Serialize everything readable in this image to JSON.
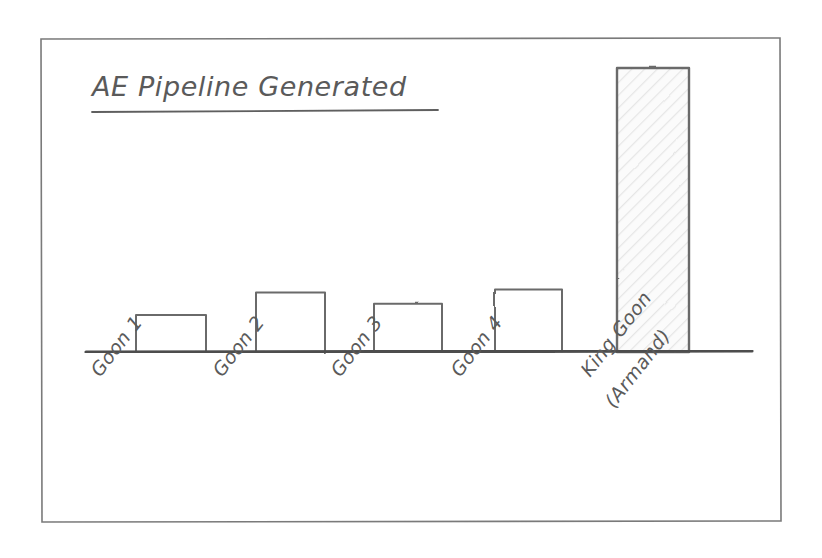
{
  "chart_data": {
    "type": "bar",
    "title": "AE Pipeline Generated",
    "xlabel": "",
    "ylabel": "",
    "categories": [
      "Goon 1",
      "Goon 2",
      "Goon 3",
      "Goon 4",
      "King Goon (Armand)"
    ],
    "category_lines": [
      [
        "Goon 1"
      ],
      [
        "Goon 2"
      ],
      [
        "Goon 3"
      ],
      [
        "Goon 4"
      ],
      [
        "King Goon",
        "(Armand)"
      ]
    ],
    "values": [
      13,
      21,
      17,
      22,
      100
    ],
    "ylim": [
      0,
      105
    ],
    "grid": false,
    "legend": null,
    "axis_ticks_visible": false,
    "y_axis_visible": false,
    "style": "hand-drawn sketch",
    "annotations": []
  },
  "figure": {
    "border_label": "sketch frame",
    "background_color": "#ffffff",
    "ink_color": "#5a5a5a",
    "axis_color": "#4d4d4d",
    "bar_fill": "#ffffff",
    "tall_bar_fill": "#f2f2f2"
  }
}
